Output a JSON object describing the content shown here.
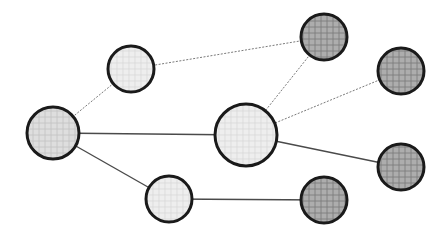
{
  "diagram": {
    "type": "network-graph",
    "width": 447,
    "height": 239,
    "colors": {
      "background": "#ffffff",
      "stroke": "#1a1a1a",
      "light_fill": "#ececec",
      "mid_fill": "#dcdcdc",
      "dark_fill": "#a9a9a9",
      "solid_edge": "#4a4a4a",
      "dotted_edge": "#7a7a7a"
    },
    "nodes": [
      {
        "id": "left",
        "cx": 53,
        "cy": 133,
        "r": 26,
        "fill": "mid"
      },
      {
        "id": "top-left",
        "cx": 131,
        "cy": 69,
        "r": 23,
        "fill": "light"
      },
      {
        "id": "center",
        "cx": 246,
        "cy": 135,
        "r": 31,
        "fill": "light"
      },
      {
        "id": "bottom-left",
        "cx": 169,
        "cy": 199,
        "r": 23,
        "fill": "light"
      },
      {
        "id": "top-right",
        "cx": 324,
        "cy": 37,
        "r": 23,
        "fill": "dark"
      },
      {
        "id": "right-upper",
        "cx": 401,
        "cy": 71,
        "r": 23,
        "fill": "dark"
      },
      {
        "id": "right-lower",
        "cx": 401,
        "cy": 167,
        "r": 23,
        "fill": "dark"
      },
      {
        "id": "bottom-right",
        "cx": 324,
        "cy": 200,
        "r": 23,
        "fill": "dark"
      }
    ],
    "edges": [
      {
        "from": "left",
        "to": "top-left",
        "style": "dotted"
      },
      {
        "from": "top-left",
        "to": "top-right",
        "style": "dotted"
      },
      {
        "from": "center",
        "to": "top-right",
        "style": "dotted"
      },
      {
        "from": "center",
        "to": "right-upper",
        "style": "dotted"
      },
      {
        "from": "left",
        "to": "center",
        "style": "solid"
      },
      {
        "from": "left",
        "to": "bottom-left",
        "style": "solid"
      },
      {
        "from": "center",
        "to": "right-lower",
        "style": "solid"
      },
      {
        "from": "bottom-left",
        "to": "bottom-right",
        "style": "solid"
      }
    ]
  }
}
